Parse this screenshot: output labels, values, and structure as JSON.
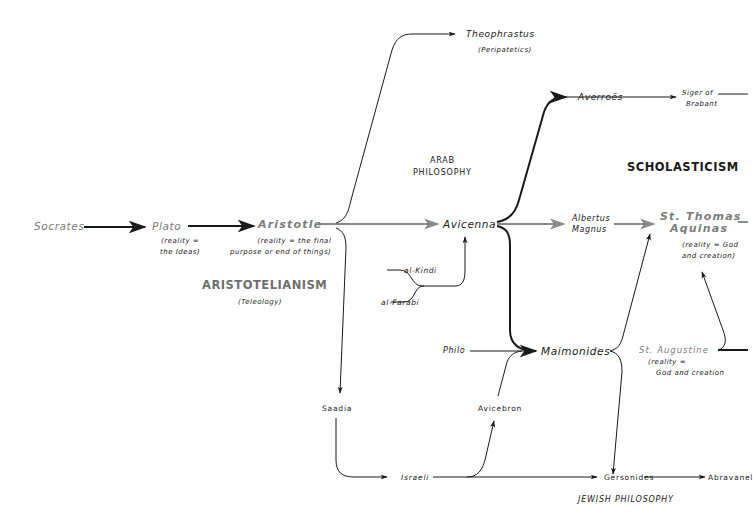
{
  "diagram": {
    "sections": {
      "arab_philosophy": [
        "ARAB",
        "PHILOSOPHY"
      ],
      "scholasticism": "SCHOLASTICISM",
      "aristotelianism": "ARISTOTELIANISM",
      "aristotelianism_sub": "(Teleology)",
      "jewish_philosophy": "JEWISH PHILOSOPHY"
    },
    "nodes": {
      "socrates": "Socrates",
      "plato": "Plato",
      "plato_note": [
        "(reality =",
        "the Ideas)"
      ],
      "aristotle": "Aristotle",
      "aristotle_note": [
        "(reality = the final",
        "purpose or end of things)"
      ],
      "theophrastus": "Theophrastus",
      "theophrastus_note": "(Peripatetics)",
      "avicenna": "Avicenna",
      "al_kindi": "al-Kindi",
      "al_farabi": "al-Farabi",
      "averroes": "Averroës",
      "siger": [
        "Siger of",
        "Brabant"
      ],
      "albertus": [
        "Albertus",
        "Magnus"
      ],
      "aquinas": [
        "St. Thomas",
        "Aquinas"
      ],
      "aquinas_note": [
        "(reality = God",
        "and creation)"
      ],
      "philo": "Philo",
      "maimonides": "Maimonides",
      "augustine": "St. Augustine",
      "augustine_note": [
        "(reality =",
        "God and creation"
      ],
      "saadia": "Saadia",
      "avicebron": "Avicebron",
      "israeli": "Israeli",
      "gersonides": "Gersonides",
      "abravanel": "Abravanel"
    },
    "colors": {
      "ink": "#1a1a1a",
      "gray_ink": "#7a7a7a",
      "gray_arrow": "#8a8a8a"
    }
  }
}
